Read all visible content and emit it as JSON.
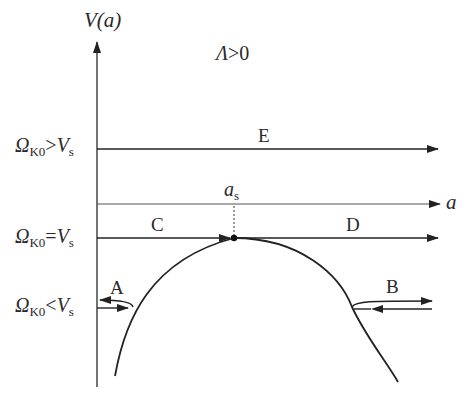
{
  "diagram": {
    "y_axis_label": {
      "main": "V",
      "arg": "(a)"
    },
    "x_axis_label": "a",
    "condition": {
      "symbol": "Λ",
      "rest": ">0"
    },
    "peak_label": {
      "main": "a",
      "sub": "s"
    },
    "levels": [
      {
        "id": "above",
        "omega": "Ω",
        "omega_sub": "K0",
        "rel": ">",
        "v": "V",
        "v_sub": "s"
      },
      {
        "id": "equal",
        "omega": "Ω",
        "omega_sub": "K0",
        "rel": "=",
        "v": "V",
        "v_sub": "s"
      },
      {
        "id": "below",
        "omega": "Ω",
        "omega_sub": "K0",
        "rel": "<",
        "v": "V",
        "v_sub": "s"
      }
    ],
    "trajectory_labels": {
      "A": "A",
      "B": "B",
      "C": "C",
      "D": "D",
      "E": "E"
    }
  },
  "colors": {
    "line": "#222222",
    "background": "#ffffff"
  }
}
